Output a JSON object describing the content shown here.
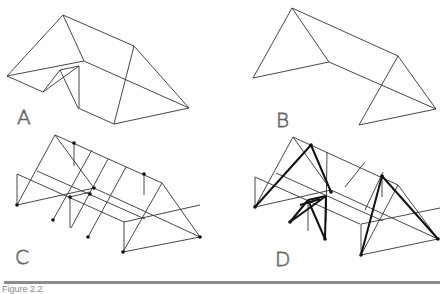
{
  "panels": [
    {
      "id": "A",
      "label": "A"
    },
    {
      "id": "B",
      "label": "B"
    },
    {
      "id": "C",
      "label": "C"
    },
    {
      "id": "D",
      "label": "D"
    }
  ],
  "caption": "Figure 2.2"
}
